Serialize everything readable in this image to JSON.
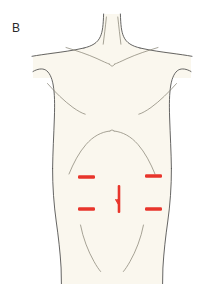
{
  "figure": {
    "panel_label": "B",
    "caption_visible": false,
    "background_color": "#ffffff",
    "illustration_type": "anatomical-line-drawing"
  },
  "colors": {
    "skin_fill": "#faf7ee",
    "outline_stroke": "#4a4a4a",
    "inner_detail_stroke": "#8a8577",
    "marking_red": "#e8352b",
    "label_text": "#2a2a2a"
  },
  "anatomy": {
    "regions": [
      {
        "name": "neck",
        "label": "neck"
      },
      {
        "name": "clavicle-left",
        "label": "left clavicle"
      },
      {
        "name": "clavicle-right",
        "label": "right clavicle"
      },
      {
        "name": "suprasternal-notch",
        "label": "suprasternal notch"
      },
      {
        "name": "shoulder-left",
        "label": "left shoulder"
      },
      {
        "name": "shoulder-right",
        "label": "right shoulder"
      },
      {
        "name": "pectoral-fold-left",
        "label": "left pectoral fold"
      },
      {
        "name": "pectoral-fold-right",
        "label": "right pectoral fold"
      },
      {
        "name": "costal-margin",
        "label": "costal margin"
      },
      {
        "name": "abdomen",
        "label": "abdomen"
      },
      {
        "name": "inguinal-fold-left",
        "label": "left inguinal fold"
      },
      {
        "name": "inguinal-fold-right",
        "label": "right inguinal fold"
      }
    ]
  },
  "markings": {
    "description": "surgical port / incision site markings",
    "color": "#e8352b",
    "ports": [
      {
        "id": "upper-left-port",
        "label": "upper left port",
        "orientation": "horizontal",
        "x": 78,
        "y": 177,
        "length": 17,
        "thickness": 3.4
      },
      {
        "id": "upper-right-port",
        "label": "upper right port",
        "orientation": "horizontal",
        "x": 145,
        "y": 176,
        "length": 17,
        "thickness": 3.4
      },
      {
        "id": "lower-left-port",
        "label": "lower left port",
        "orientation": "horizontal",
        "x": 78,
        "y": 209,
        "length": 17,
        "thickness": 3.4
      },
      {
        "id": "lower-right-port",
        "label": "lower right port",
        "orientation": "horizontal",
        "x": 145,
        "y": 209,
        "length": 17,
        "thickness": 3.4
      }
    ],
    "midline_incision": {
      "id": "midline-incision",
      "label": "midline vertical incision with arrow",
      "orientation": "vertical",
      "x": 119,
      "y_top": 185,
      "y_bottom": 213,
      "thickness": 2.6,
      "arrow": {
        "direction": "down",
        "tip_y": 206,
        "span": 7
      }
    }
  }
}
